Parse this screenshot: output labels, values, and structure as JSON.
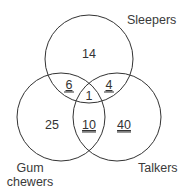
{
  "diagram": {
    "type": "venn-3",
    "sets": [
      {
        "name": "sleepers",
        "label": "Sleepers"
      },
      {
        "name": "gum-chewers",
        "label_line1": "Gum",
        "label_line2": "chewers"
      },
      {
        "name": "talkers",
        "label": "Talkers"
      }
    ],
    "regions": {
      "sleepers_only": "14",
      "gum_only": "25",
      "talkers_only": "40",
      "sleepers_gum": "6",
      "sleepers_talkers": "4",
      "gum_talkers": "10",
      "all_three": "1"
    },
    "stroke_color": "#333333"
  }
}
